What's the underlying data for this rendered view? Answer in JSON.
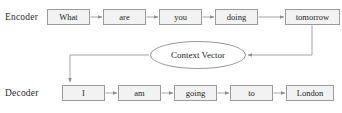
{
  "diagram": {
    "line_color": "#9a9a9a",
    "box_fill": "#f2f2f2",
    "text_color": "#1f1f1f",
    "background": "#ffffff",
    "rows": {
      "encoder": {
        "label": "Encoder",
        "tokens": [
          {
            "text": "What",
            "x": 47,
            "width": 43
          },
          {
            "text": "are",
            "x": 103,
            "width": 43
          },
          {
            "text": "you",
            "x": 159,
            "width": 43
          },
          {
            "text": "doing",
            "x": 215,
            "width": 43
          },
          {
            "text": "tomorrow",
            "x": 285,
            "width": 55
          }
        ]
      },
      "decoder": {
        "label": "Decoder",
        "tokens": [
          {
            "text": "I",
            "x": 62,
            "width": 43
          },
          {
            "text": "am",
            "x": 118,
            "width": 43
          },
          {
            "text": "going",
            "x": 174,
            "width": 43
          },
          {
            "text": "to",
            "x": 230,
            "width": 43
          },
          {
            "text": "London",
            "x": 286,
            "width": 48
          }
        ]
      }
    },
    "context_node": {
      "label": "Context Vector",
      "shape": "ellipse"
    },
    "edges": [
      {
        "name": "what-to-are",
        "from": "What",
        "to": "are"
      },
      {
        "name": "are-to-you",
        "from": "are",
        "to": "you"
      },
      {
        "name": "you-to-doing",
        "from": "you",
        "to": "doing"
      },
      {
        "name": "doing-to-tomorrow",
        "from": "doing",
        "to": "tomorrow"
      },
      {
        "name": "tomorrow-to-context",
        "from": "tomorrow",
        "to": "Context Vector"
      },
      {
        "name": "context-to-i",
        "from": "Context Vector",
        "to": "I"
      },
      {
        "name": "i-to-am",
        "from": "I",
        "to": "am"
      },
      {
        "name": "am-to-going",
        "from": "am",
        "to": "going"
      },
      {
        "name": "going-to-to",
        "from": "going",
        "to": "to"
      },
      {
        "name": "to-to-london",
        "from": "to",
        "to": "London"
      }
    ]
  }
}
